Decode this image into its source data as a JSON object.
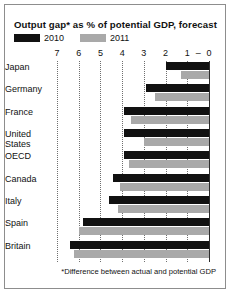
{
  "title": "Output gap* as % of potential GDP, forecast",
  "footnote": "*Difference between actual and potential GDP",
  "legend": [
    {
      "label": "2010",
      "color": "#111111"
    },
    {
      "label": "2011",
      "color": "#a9a9a9"
    }
  ],
  "colors": {
    "series_2010": "#111111",
    "series_2011": "#a9a9a9",
    "gridline": "#6f6f6f",
    "zero_line": "#2b2b2b",
    "border": "#8d8d8d",
    "background": "#ffffff",
    "text": "#111111"
  },
  "axis": {
    "ticks": [
      "7",
      "6",
      "5",
      "4",
      "3",
      "2",
      "1",
      "–",
      "0"
    ],
    "tick_values": [
      7,
      6,
      5,
      4,
      3,
      2,
      1,
      0.5,
      0
    ],
    "direction": "descending-left-to-right",
    "min": 0,
    "max": 7
  },
  "chart_data": {
    "type": "bar",
    "orientation": "horizontal",
    "title": "Output gap* as % of potential GDP, forecast",
    "xlabel": "",
    "ylabel": "",
    "xlim": [
      7,
      0
    ],
    "note": "Values are output gaps, plotted as magnitudes of negative percentages; axis runs 7 at left to 0 at right.",
    "grid": true,
    "legend_position": "top-left",
    "categories": [
      "Japan",
      "Germany",
      "France",
      "United States",
      "OECD",
      "Canada",
      "Italy",
      "Spain",
      "Britain"
    ],
    "series": [
      {
        "name": "2010",
        "color": "#111111",
        "values": [
          2.0,
          2.9,
          3.9,
          3.9,
          3.9,
          4.4,
          4.6,
          5.8,
          6.4
        ]
      },
      {
        "name": "2011",
        "color": "#a9a9a9",
        "values": [
          1.3,
          2.5,
          3.6,
          3.0,
          3.7,
          4.1,
          4.2,
          6.0,
          6.2
        ]
      }
    ]
  }
}
